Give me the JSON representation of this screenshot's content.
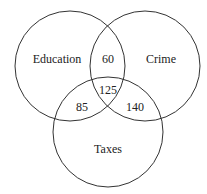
{
  "diagram": {
    "type": "venn",
    "sets": [
      {
        "name": "Education",
        "cx": 70,
        "cy": 66,
        "r": 55
      },
      {
        "name": "Crime",
        "cx": 145,
        "cy": 66,
        "r": 55
      },
      {
        "name": "Taxes",
        "cx": 108,
        "cy": 132,
        "r": 55
      }
    ],
    "regions": {
      "education_crime": "60",
      "all_three": "125",
      "education_taxes": "85",
      "crime_taxes": "140"
    }
  }
}
